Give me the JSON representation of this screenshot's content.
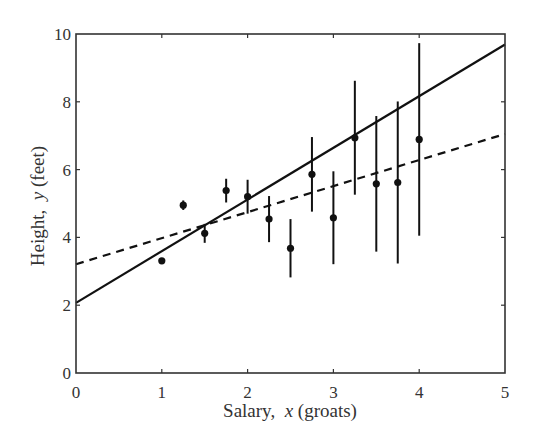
{
  "chart_data": {
    "type": "scatter",
    "title": "",
    "xlabel": "Salary,  x (groats)",
    "xlabel_parts": {
      "pre": "Salary,  ",
      "var": "x",
      "post": " (groats)"
    },
    "ylabel": "Height,  y (feet)",
    "ylabel_parts": {
      "pre": "Height,  ",
      "var": "y",
      "post": " (feet)"
    },
    "xlim": [
      0,
      5
    ],
    "ylim": [
      0,
      10
    ],
    "x_ticks": [
      0,
      1,
      2,
      3,
      4,
      5
    ],
    "y_ticks": [
      0,
      2,
      4,
      6,
      8,
      10
    ],
    "grid": false,
    "legend": null,
    "series": [
      {
        "name": "data",
        "kind": "errorbar",
        "marker": "filled-circle",
        "color": "#111111",
        "points": [
          {
            "x": 1.0,
            "y": 3.31,
            "err": 0.05
          },
          {
            "x": 1.25,
            "y": 4.95,
            "err": 0.14
          },
          {
            "x": 1.5,
            "y": 4.12,
            "err": 0.28
          },
          {
            "x": 1.75,
            "y": 5.38,
            "err": 0.35
          },
          {
            "x": 2.0,
            "y": 5.2,
            "err": 0.5
          },
          {
            "x": 2.25,
            "y": 4.54,
            "err": 0.68
          },
          {
            "x": 2.5,
            "y": 3.68,
            "err": 0.86
          },
          {
            "x": 2.75,
            "y": 5.86,
            "err": 1.1
          },
          {
            "x": 3.0,
            "y": 4.58,
            "err": 1.37
          },
          {
            "x": 3.25,
            "y": 6.94,
            "err": 1.68
          },
          {
            "x": 3.5,
            "y": 5.58,
            "err": 2.0
          },
          {
            "x": 3.75,
            "y": 5.62,
            "err": 2.39
          },
          {
            "x": 4.0,
            "y": 6.89,
            "err": 2.84
          }
        ]
      },
      {
        "name": "fit-solid",
        "kind": "line",
        "style": "solid",
        "color": "#111111",
        "x": [
          0,
          5
        ],
        "y": [
          2.07,
          9.69
        ]
      },
      {
        "name": "fit-dashed",
        "kind": "line",
        "style": "dashed",
        "color": "#111111",
        "x": [
          0,
          5
        ],
        "y": [
          3.21,
          7.05
        ]
      }
    ]
  }
}
